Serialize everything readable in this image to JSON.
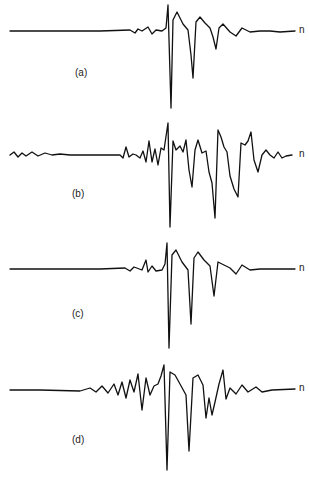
{
  "chart_data": {
    "type": "line",
    "title": "",
    "xlabel": "n",
    "ylabel": "",
    "grid": false,
    "legend": null,
    "panels": [
      {
        "label": "(a)",
        "axis_label": "n",
        "baseline_y": 31,
        "description": "Quiet baseline, then sharp spike with deep negative trough followed by two smaller negative troughs of decreasing depth",
        "points": [
          [
            10,
            31
          ],
          [
            100,
            31
          ],
          [
            130,
            30
          ],
          [
            135,
            33
          ],
          [
            138,
            29
          ],
          [
            142,
            31
          ],
          [
            148,
            27
          ],
          [
            152,
            34
          ],
          [
            156,
            30
          ],
          [
            162,
            31
          ],
          [
            166,
            28
          ],
          [
            168,
            5
          ],
          [
            171,
            108
          ],
          [
            173,
            20
          ],
          [
            177,
            12
          ],
          [
            183,
            24
          ],
          [
            188,
            30
          ],
          [
            191,
            55
          ],
          [
            193,
            78
          ],
          [
            196,
            22
          ],
          [
            200,
            17
          ],
          [
            205,
            23
          ],
          [
            210,
            28
          ],
          [
            213,
            37
          ],
          [
            216,
            49
          ],
          [
            219,
            28
          ],
          [
            223,
            24
          ],
          [
            230,
            32
          ],
          [
            236,
            36
          ],
          [
            242,
            28
          ],
          [
            250,
            32
          ],
          [
            260,
            31
          ],
          [
            270,
            31
          ],
          [
            280,
            32
          ],
          [
            295,
            31
          ]
        ]
      },
      {
        "label": "(b)",
        "axis_label": "n",
        "baseline_y": 155,
        "description": "Low-amplitude oscillation before onset, then highly oscillatory signal with multiple large negative troughs",
        "points": [
          [
            10,
            155
          ],
          [
            14,
            152
          ],
          [
            18,
            157
          ],
          [
            22,
            153
          ],
          [
            26,
            156
          ],
          [
            32,
            152
          ],
          [
            38,
            156
          ],
          [
            45,
            153
          ],
          [
            52,
            155
          ],
          [
            60,
            154
          ],
          [
            70,
            155
          ],
          [
            90,
            155
          ],
          [
            120,
            155
          ],
          [
            123,
            158
          ],
          [
            126,
            147
          ],
          [
            129,
            157
          ],
          [
            133,
            154
          ],
          [
            136,
            155
          ],
          [
            140,
            158
          ],
          [
            143,
            151
          ],
          [
            146,
            162
          ],
          [
            149,
            141
          ],
          [
            152,
            162
          ],
          [
            155,
            149
          ],
          [
            158,
            165
          ],
          [
            161,
            148
          ],
          [
            164,
            150
          ],
          [
            168,
            123
          ],
          [
            170,
            227
          ],
          [
            173,
            141
          ],
          [
            176,
            150
          ],
          [
            180,
            146
          ],
          [
            183,
            152
          ],
          [
            186,
            140
          ],
          [
            189,
            170
          ],
          [
            192,
            187
          ],
          [
            195,
            150
          ],
          [
            198,
            140
          ],
          [
            202,
            153
          ],
          [
            206,
            151
          ],
          [
            209,
            172
          ],
          [
            212,
            183
          ],
          [
            215,
            218
          ],
          [
            218,
            130
          ],
          [
            221,
            137
          ],
          [
            224,
            147
          ],
          [
            227,
            152
          ],
          [
            230,
            176
          ],
          [
            234,
            189
          ],
          [
            238,
            197
          ],
          [
            241,
            143
          ],
          [
            245,
            145
          ],
          [
            248,
            141
          ],
          [
            251,
            132
          ],
          [
            254,
            160
          ],
          [
            258,
            172
          ],
          [
            262,
            155
          ],
          [
            266,
            150
          ],
          [
            270,
            155
          ],
          [
            274,
            158
          ],
          [
            278,
            152
          ],
          [
            282,
            158
          ],
          [
            286,
            156
          ],
          [
            292,
            155
          ]
        ]
      },
      {
        "label": "(c)",
        "axis_label": "n",
        "baseline_y": 269,
        "description": "Similar to (a): quiet baseline, small precursor bumps, sharp spike with deep trough, then two decreasing negative troughs",
        "points": [
          [
            10,
            269
          ],
          [
            100,
            269
          ],
          [
            125,
            268
          ],
          [
            130,
            271
          ],
          [
            134,
            267
          ],
          [
            142,
            270
          ],
          [
            146,
            260
          ],
          [
            148,
            272
          ],
          [
            152,
            266
          ],
          [
            156,
            271
          ],
          [
            162,
            270
          ],
          [
            165,
            264
          ],
          [
            167,
            243
          ],
          [
            169,
            348
          ],
          [
            172,
            255
          ],
          [
            176,
            250
          ],
          [
            182,
            262
          ],
          [
            188,
            270
          ],
          [
            191,
            324
          ],
          [
            194,
            258
          ],
          [
            198,
            252
          ],
          [
            204,
            260
          ],
          [
            210,
            266
          ],
          [
            214,
            296
          ],
          [
            218,
            262
          ],
          [
            224,
            265
          ],
          [
            230,
            268
          ],
          [
            236,
            274
          ],
          [
            242,
            265
          ],
          [
            250,
            270
          ],
          [
            260,
            269
          ],
          [
            275,
            269
          ],
          [
            295,
            269
          ]
        ]
      },
      {
        "label": "(d)",
        "axis_label": "n",
        "baseline_y": 390,
        "description": "Quiet baseline with small oscillations building, sharp spike with deep trough, second deep trough, and oscillatory cluster of troughs",
        "points": [
          [
            10,
            390
          ],
          [
            40,
            390
          ],
          [
            80,
            391
          ],
          [
            90,
            388
          ],
          [
            96,
            392
          ],
          [
            102,
            386
          ],
          [
            108,
            393
          ],
          [
            114,
            384
          ],
          [
            118,
            395
          ],
          [
            122,
            382
          ],
          [
            126,
            398
          ],
          [
            130,
            380
          ],
          [
            134,
            392
          ],
          [
            138,
            374
          ],
          [
            142,
            410
          ],
          [
            146,
            378
          ],
          [
            150,
            395
          ],
          [
            154,
            386
          ],
          [
            158,
            384
          ],
          [
            161,
            376
          ],
          [
            164,
            365
          ],
          [
            167,
            470
          ],
          [
            170,
            372
          ],
          [
            175,
            375
          ],
          [
            180,
            384
          ],
          [
            186,
            395
          ],
          [
            189,
            451
          ],
          [
            193,
            378
          ],
          [
            198,
            375
          ],
          [
            203,
            385
          ],
          [
            206,
            418
          ],
          [
            209,
            398
          ],
          [
            212,
            415
          ],
          [
            215,
            402
          ],
          [
            219,
            384
          ],
          [
            223,
            370
          ],
          [
            226,
            399
          ],
          [
            230,
            388
          ],
          [
            236,
            394
          ],
          [
            242,
            385
          ],
          [
            248,
            392
          ],
          [
            256,
            387
          ],
          [
            262,
            392
          ],
          [
            272,
            390
          ],
          [
            295,
            389
          ]
        ]
      }
    ],
    "panel_labels": [
      "(a)",
      "(b)",
      "(c)",
      "(d)"
    ]
  },
  "labels": {
    "a": "(a)",
    "b": "(b)",
    "c": "(c)",
    "d": "(d)",
    "n": "n"
  }
}
